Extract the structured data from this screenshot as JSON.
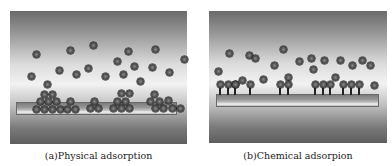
{
  "figure": {
    "panels": [
      {
        "id": "a",
        "caption": "(a)Physical adsorption",
        "box": {
          "x": 10,
          "y": 11,
          "w": 177,
          "h": 133
        },
        "surface": {
          "x": 16,
          "y": 102,
          "w": 161,
          "h": 13
        },
        "free_molecules": [
          [
            36,
            54
          ],
          [
            70,
            50
          ],
          [
            93,
            45
          ],
          [
            128,
            51
          ],
          [
            155,
            49
          ],
          [
            184,
            59
          ],
          [
            59,
            70
          ],
          [
            76,
            74
          ],
          [
            88,
            68
          ],
          [
            105,
            76
          ],
          [
            117,
            61
          ],
          [
            123,
            74
          ],
          [
            134,
            66
          ],
          [
            152,
            67
          ],
          [
            169,
            72
          ],
          [
            140,
            81
          ],
          [
            31,
            76
          ]
        ],
        "adsorbed_layers": [
          [
            47,
            84
          ],
          [
            44,
            94
          ],
          [
            52,
            94
          ],
          [
            40,
            101
          ],
          [
            48,
            101
          ],
          [
            56,
            101
          ],
          [
            36,
            109
          ],
          [
            44,
            109
          ],
          [
            52,
            109
          ],
          [
            60,
            109
          ],
          [
            67,
            109
          ],
          [
            75,
            109
          ],
          [
            70,
            101
          ],
          [
            94,
            101
          ],
          [
            90,
            108
          ],
          [
            98,
            108
          ],
          [
            121,
            93
          ],
          [
            129,
            93
          ],
          [
            117,
            101
          ],
          [
            125,
            101
          ],
          [
            113,
            108
          ],
          [
            121,
            108
          ],
          [
            129,
            108
          ],
          [
            154,
            94
          ],
          [
            150,
            101
          ],
          [
            159,
            101
          ],
          [
            168,
            100
          ],
          [
            155,
            108
          ],
          [
            163,
            108
          ],
          [
            172,
            108
          ],
          [
            180,
            108
          ]
        ]
      },
      {
        "id": "b",
        "caption": "(b)Chemical adsorpion",
        "box": {
          "x": 209,
          "y": 11,
          "w": 178,
          "h": 132
        },
        "surface": {
          "x": 216,
          "y": 94,
          "w": 163,
          "h": 13
        },
        "free_molecules": [
          [
            229,
            53
          ],
          [
            249,
            55
          ],
          [
            255,
            58
          ],
          [
            283,
            49
          ],
          [
            218,
            71
          ],
          [
            235,
            84
          ],
          [
            242,
            80
          ],
          [
            274,
            65
          ],
          [
            263,
            79
          ],
          [
            288,
            77
          ],
          [
            299,
            61
          ],
          [
            311,
            58
          ],
          [
            313,
            69
          ],
          [
            324,
            60
          ],
          [
            340,
            60
          ],
          [
            352,
            65
          ],
          [
            362,
            60
          ],
          [
            370,
            65
          ],
          [
            335,
            77
          ],
          [
            374,
            85
          ]
        ],
        "chemisorbed": [
          220,
          228,
          235,
          250,
          280,
          288,
          315,
          323,
          330,
          343,
          351,
          359
        ],
        "chemisorbed_ball_y": 84
      }
    ]
  }
}
